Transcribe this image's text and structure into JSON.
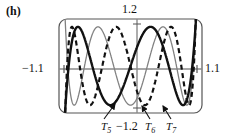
{
  "figure": {
    "panel_label": "(h)",
    "axis_labels": {
      "x_min": "−1.1",
      "x_max": "1.1",
      "y_max": "1.2",
      "y_min": "−1.2"
    },
    "annotations": [
      {
        "id": "t5",
        "text": "T",
        "subscript": "5"
      },
      {
        "id": "t6",
        "text": "T",
        "subscript": "6"
      },
      {
        "id": "t7",
        "text": "T",
        "subscript": "7"
      }
    ],
    "colors": {
      "curve_t5": "#111111",
      "curve_t6": "#808080",
      "curve_t7": "#111111",
      "frame": "#555555",
      "axis": "#888888"
    }
  },
  "chart_data": {
    "type": "line",
    "title": "",
    "xlabel": "",
    "ylabel": "",
    "xlim": [
      -1.1,
      1.1
    ],
    "ylim": [
      -1.2,
      1.2
    ],
    "grid": false,
    "legend": "inline-annotations",
    "x_tick_labels": [
      "−1.1",
      "1.1"
    ],
    "y_tick_labels": [
      "1.2",
      "−1.2"
    ],
    "series": [
      {
        "name": "T5",
        "style": "solid-bold",
        "color": "#111111",
        "formula": "T5(x) = 16x^5 - 20x^3 + 5x",
        "x": [
          -1.1,
          -1.05,
          -1.0,
          -0.95,
          -0.9,
          -0.85,
          -0.8,
          -0.75,
          -0.7,
          -0.65,
          -0.6,
          -0.55,
          -0.5,
          -0.45,
          -0.4,
          -0.35,
          -0.3,
          -0.25,
          -0.2,
          -0.15,
          -0.1,
          -0.05,
          0.0,
          0.05,
          0.1,
          0.15,
          0.2,
          0.25,
          0.3,
          0.35,
          0.4,
          0.45,
          0.5,
          0.55,
          0.6,
          0.65,
          0.7,
          0.75,
          0.8,
          0.85,
          0.9,
          0.95,
          1.0,
          1.05,
          1.1
        ],
        "y": [
          -2.34,
          -1.55,
          -1.0,
          -0.62,
          -0.36,
          -0.18,
          -0.06,
          0.04,
          0.12,
          0.22,
          0.33,
          0.46,
          0.59,
          0.71,
          0.79,
          0.82,
          0.78,
          0.66,
          0.48,
          0.25,
          0.01,
          -0.24,
          0.0,
          0.24,
          -0.01,
          -0.25,
          -0.48,
          -0.66,
          -0.78,
          -0.82,
          -0.79,
          -0.71,
          -0.59,
          -0.46,
          -0.33,
          -0.22,
          -0.12,
          -0.04,
          0.06,
          0.18,
          0.36,
          0.62,
          1.0,
          1.55,
          2.34
        ]
      },
      {
        "name": "T6",
        "style": "solid-light",
        "color": "#808080",
        "formula": "T6(x) = 32x^6 - 48x^4 + 18x^2 - 1",
        "x": [
          -1.1,
          -1.0,
          -0.9,
          -0.8,
          -0.7,
          -0.6,
          -0.5,
          -0.4,
          -0.3,
          -0.2,
          -0.1,
          0.0,
          0.1,
          0.2,
          0.3,
          0.4,
          0.5,
          0.6,
          0.7,
          0.8,
          0.9,
          1.0,
          1.1
        ],
        "y": [
          3.14,
          1.0,
          0.11,
          -0.37,
          -0.59,
          -0.62,
          -0.5,
          -0.29,
          -0.06,
          0.15,
          0.3,
          0.38,
          0.3,
          0.15,
          -0.06,
          -0.29,
          -0.5,
          -0.62,
          -0.59,
          -0.37,
          0.11,
          1.0,
          3.14
        ]
      },
      {
        "name": "T7",
        "style": "dashed",
        "color": "#111111",
        "formula": "T7(x) = 64x^7 - 112x^5 + 56x^3 - 7x",
        "x": [
          -1.1,
          -1.0,
          -0.9,
          -0.8,
          -0.7,
          -0.6,
          -0.5,
          -0.4,
          -0.3,
          -0.2,
          -0.1,
          0.0,
          0.1,
          0.2,
          0.3,
          0.4,
          0.5,
          0.6,
          0.7,
          0.8,
          0.9,
          1.0,
          1.1
        ],
        "y": [
          -3.87,
          -1.0,
          0.15,
          0.62,
          0.66,
          0.42,
          0.03,
          -0.35,
          -0.6,
          -0.64,
          -0.44,
          0.0,
          0.44,
          0.64,
          0.6,
          0.35,
          -0.03,
          -0.42,
          -0.66,
          -0.62,
          -0.15,
          1.0,
          3.87
        ]
      }
    ]
  }
}
